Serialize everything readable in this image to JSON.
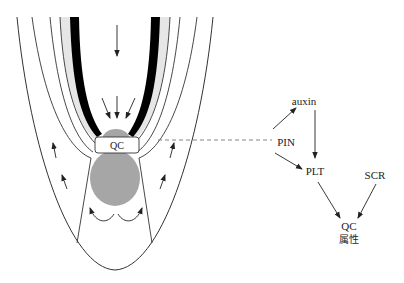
{
  "root_diagram": {
    "qc_label": "QC",
    "colors": {
      "stele_band": "#000000",
      "endodermis_band": "#e6e6e6",
      "stem_cell_niche": "#a6a6a6",
      "lines": "#333333",
      "dashed_connector": "#777777"
    }
  },
  "network": {
    "nodes": {
      "pin": "PIN",
      "auxin": "auxin",
      "plt": "PLT",
      "scr": "SCR",
      "qc": "QC",
      "qc_property": "属性"
    },
    "edges": [
      {
        "from": "PIN",
        "to": "auxin"
      },
      {
        "from": "PIN",
        "to": "PLT"
      },
      {
        "from": "auxin",
        "to": "PLT"
      },
      {
        "from": "PLT",
        "to": "QC 属性"
      },
      {
        "from": "SCR",
        "to": "QC 属性"
      }
    ]
  }
}
